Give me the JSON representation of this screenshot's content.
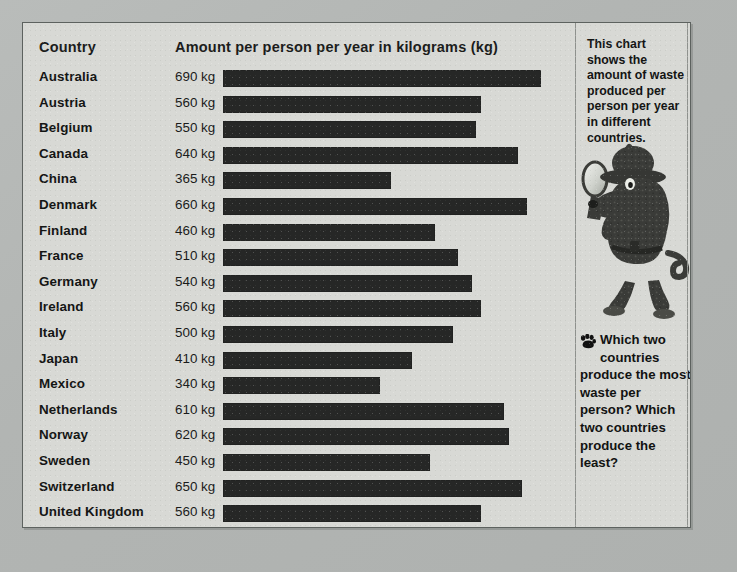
{
  "chart_data": {
    "type": "bar",
    "orientation": "horizontal",
    "title": "Amount per person per year in kilograms (kg)",
    "category_header": "Country",
    "xlabel": "Amount per person per year in kilograms (kg)",
    "ylabel": "Country",
    "unit": "kg",
    "grid": false,
    "legend": "none",
    "xlim": [
      0,
      760
    ],
    "categories": [
      "Australia",
      "Austria",
      "Belgium",
      "Canada",
      "China",
      "Denmark",
      "Finland",
      "France",
      "Germany",
      "Ireland",
      "Italy",
      "Japan",
      "Mexico",
      "Netherlands",
      "Norway",
      "Sweden",
      "Switzerland",
      "United Kingdom",
      "United States"
    ],
    "values": [
      690,
      560,
      550,
      640,
      365,
      660,
      460,
      510,
      540,
      560,
      500,
      410,
      340,
      610,
      620,
      450,
      650,
      560,
      760
    ],
    "value_labels": [
      "690 kg",
      "560 kg",
      "550 kg",
      "640 kg",
      "365 kg",
      "660 kg",
      "460 kg",
      "510 kg",
      "540 kg",
      "560 kg",
      "500 kg",
      "410 kg",
      "340 kg",
      "610 kg",
      "620 kg",
      "450 kg",
      "650 kg",
      "560 kg",
      "760 kg"
    ],
    "bar_color": "#262726",
    "background_color": "#d8d9d5",
    "rows": [
      {
        "country": "Australia",
        "value": 690,
        "label": "690 kg"
      },
      {
        "country": "Austria",
        "value": 560,
        "label": "560 kg"
      },
      {
        "country": "Belgium",
        "value": 550,
        "label": "550 kg"
      },
      {
        "country": "Canada",
        "value": 640,
        "label": "640 kg"
      },
      {
        "country": "China",
        "value": 365,
        "label": "365 kg"
      },
      {
        "country": "Denmark",
        "value": 660,
        "label": "660 kg"
      },
      {
        "country": "Finland",
        "value": 460,
        "label": "460 kg"
      },
      {
        "country": "France",
        "value": 510,
        "label": "510 kg"
      },
      {
        "country": "Germany",
        "value": 540,
        "label": "540 kg"
      },
      {
        "country": "Ireland",
        "value": 560,
        "label": "560 kg"
      },
      {
        "country": "Italy",
        "value": 500,
        "label": "500 kg"
      },
      {
        "country": "Japan",
        "value": 410,
        "label": "410 kg"
      },
      {
        "country": "Mexico",
        "value": 340,
        "label": "340 kg"
      },
      {
        "country": "Netherlands",
        "value": 610,
        "label": "610 kg"
      },
      {
        "country": "Norway",
        "value": 620,
        "label": "620 kg"
      },
      {
        "country": "Sweden",
        "value": 450,
        "label": "450 kg"
      },
      {
        "country": "Switzerland",
        "value": 650,
        "label": "650 kg"
      },
      {
        "country": "United Kingdom",
        "value": 560,
        "label": "560 kg"
      },
      {
        "country": "United States",
        "value": 760,
        "label": "760 kg"
      }
    ]
  },
  "side_panel": {
    "intro_text": "This chart shows the amount of waste produced per person per year in different countries.",
    "illustration_name": "detective-dog-with-magnifying-glass",
    "paw_icon": "paw-print-icon",
    "question_text": "Which two countries produce the most waste per person? Which two countries produce the least?"
  },
  "colors": {
    "page_background": "#b5b8b7",
    "sheet_background": "#d8d9d5",
    "bar": "#262726",
    "text": "#141514",
    "rule": "#8e918d"
  }
}
